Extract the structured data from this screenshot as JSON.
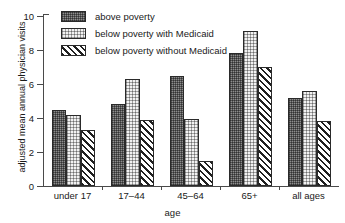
{
  "chart_data": {
    "type": "bar",
    "title": "",
    "xlabel": "age",
    "ylabel": "adjusted mean annual physician visits",
    "categories": [
      "under 17",
      "17–44",
      "45–64",
      "65+",
      "all ages"
    ],
    "series": [
      {
        "name": "above poverty",
        "pattern": "dense-stipple",
        "values": [
          4.45,
          4.8,
          6.5,
          7.85,
          5.2
        ]
      },
      {
        "name": "below poverty with Medicaid",
        "pattern": "light-dots",
        "values": [
          4.15,
          6.3,
          3.95,
          9.1,
          5.6
        ]
      },
      {
        "name": "below poverty without Medicaid",
        "pattern": "diagonal-hatch",
        "values": [
          3.3,
          3.9,
          1.5,
          7.0,
          3.8
        ]
      }
    ],
    "ylim": [
      0,
      10
    ],
    "yticks": [
      0,
      2,
      4,
      6,
      8,
      10
    ],
    "ytick_labels": [
      "0",
      "2",
      "4",
      "6",
      "8",
      "10"
    ],
    "grid": false,
    "legend_position": "top-left-inside"
  },
  "legend": {
    "entries": [
      {
        "label": "above poverty"
      },
      {
        "label": "below poverty with Medicaid"
      },
      {
        "label": "below poverty without Medicaid"
      }
    ]
  },
  "colors": {
    "axis": "#4a4a4a",
    "bar_outline": "#2a2a2a",
    "series1_fill": "#8d8d8d",
    "series2_fill": "#f2f2f2",
    "series3_fill": "#ffffff",
    "background": "#ffffff",
    "text": "#1a1a1a"
  }
}
